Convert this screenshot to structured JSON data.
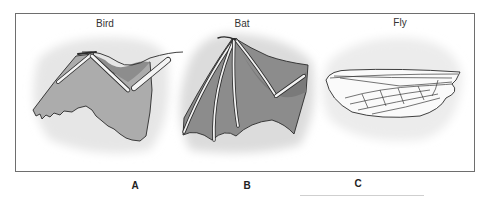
{
  "figure": {
    "panels": [
      {
        "id": "A",
        "title": "Bird",
        "letter": "A",
        "title_x": 105,
        "letter_x": 135
      },
      {
        "id": "B",
        "title": "Bat",
        "letter": "B",
        "title_x": 242,
        "letter_x": 247
      },
      {
        "id": "C",
        "title": "Fly",
        "letter": "C",
        "title_x": 400,
        "letter_x": 358
      }
    ],
    "colors": {
      "frame": "#6e6e6e",
      "halo": "#e4e4e4",
      "membrane_bird": "#a9a9a9",
      "membrane_bat": "#8f8f8f",
      "bone": "#f4f4f4",
      "outline": "#2a2a2a",
      "fly_wing": "#fafafa"
    }
  }
}
